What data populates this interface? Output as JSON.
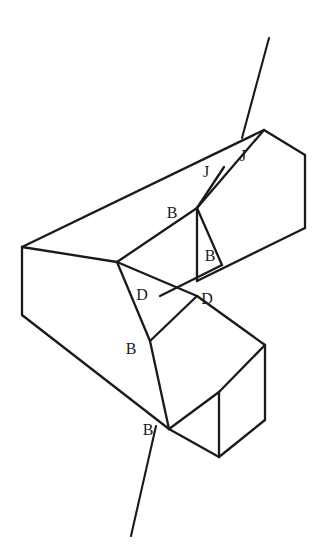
{
  "figure": {
    "type": "line-diagram",
    "background_color": "#ffffff",
    "line_color": "#1a1a1a",
    "label_color": "#1b1b1b",
    "canvas": {
      "width": 321,
      "height": 560
    }
  },
  "labels": [
    {
      "id": "j-right",
      "text": "J",
      "x": 243,
      "y": 161
    },
    {
      "id": "j-left",
      "text": "J",
      "x": 206,
      "y": 177
    },
    {
      "id": "b-upper",
      "text": "B",
      "x": 172,
      "y": 218
    },
    {
      "id": "b-right",
      "text": "B",
      "x": 210,
      "y": 261
    },
    {
      "id": "d-left",
      "text": "D",
      "x": 142,
      "y": 300
    },
    {
      "id": "d-right",
      "text": "D",
      "x": 207,
      "y": 304
    },
    {
      "id": "b-mid",
      "text": "B",
      "x": 131,
      "y": 354
    },
    {
      "id": "b-lower",
      "text": "B",
      "x": 148,
      "y": 435
    }
  ],
  "leaders": [
    {
      "id": "leader-top",
      "from_label": "J",
      "x1": 269,
      "y1": 38,
      "x2": 242,
      "y2": 138
    },
    {
      "id": "leader-bottom",
      "from_label": "B",
      "x1": 156,
      "y1": 426,
      "x2": 131,
      "y2": 536
    }
  ],
  "paths": {
    "upper_bar_top_face": "M 22 247 L 264 130 L 305 155 L 197 208",
    "upper_bar_far_top_edge": "M 264 130 L 197 208",
    "upper_bar_right_end": "M 305 155 L 305 228 L 197 281",
    "upper_bar_lower_long_edge": "M 197 208 L 197 281",
    "notch_upper_left": "M 117 262 L 197 208",
    "notch_lower_left": "M 117 262 L 197 296",
    "notch_cut_b_to_j": "M 197 208 L 224 167",
    "notch_cut_b_to_b": "M 197 208 L 222 265",
    "notch_cut_d": "M 222 265 L 160 296",
    "left_end_top": "M 22 247 L 117 262",
    "left_end_vertical": "M 22 247 L 22 315",
    "front_face_long_edge": "M 22 315 L 169 429",
    "front_face_upper_edge": "M 117 262 L 150 341",
    "lower_bar_inner_cut": "M 150 341 L 169 429",
    "lower_bar_top_face": "M 150 341 L 197 296 L 265 345 L 219 392",
    "lower_bar_front_face": "M 169 429 L 219 392 L 265 345",
    "lower_bar_right_edge": "M 265 345 L 265 420 L 219 457 L 169 429",
    "lower_bar_vertical_mid": "M 219 392 L 219 457"
  },
  "segments": [
    {
      "name": "top-face-left-ridge",
      "x1": 22,
      "y1": 247,
      "x2": 264,
      "y2": 130
    },
    {
      "name": "top-face-right-edge",
      "x1": 264,
      "y1": 130,
      "x2": 305,
      "y2": 155
    },
    {
      "name": "right-end-vertical",
      "x1": 305,
      "y1": 155,
      "x2": 305,
      "y2": 228
    },
    {
      "name": "right-end-lower-edge",
      "x1": 305,
      "y1": 228,
      "x2": 197,
      "y2": 281
    },
    {
      "name": "top-face-inner-ridge",
      "x1": 264,
      "y1": 130,
      "x2": 197,
      "y2": 208
    },
    {
      "name": "inner-vertical-face",
      "x1": 197,
      "y1": 208,
      "x2": 197,
      "y2": 281
    },
    {
      "name": "notch-top-left-edge",
      "x1": 197,
      "y1": 208,
      "x2": 117,
      "y2": 262
    },
    {
      "name": "notch-bottom-left-edge",
      "x1": 117,
      "y1": 262,
      "x2": 197,
      "y2": 296
    },
    {
      "name": "cut-j-to-b",
      "x1": 224,
      "y1": 167,
      "x2": 197,
      "y2": 208
    },
    {
      "name": "cut-b-to-b",
      "x1": 197,
      "y1": 208,
      "x2": 222,
      "y2": 265
    },
    {
      "name": "cut-d-diagonal",
      "x1": 222,
      "y1": 265,
      "x2": 160,
      "y2": 296
    },
    {
      "name": "left-end-top-edge",
      "x1": 22,
      "y1": 247,
      "x2": 117,
      "y2": 262
    },
    {
      "name": "left-end-vertical",
      "x1": 22,
      "y1": 247,
      "x2": 22,
      "y2": 315
    },
    {
      "name": "front-long-bottom-edge",
      "x1": 22,
      "y1": 315,
      "x2": 169,
      "y2": 429
    },
    {
      "name": "front-inner-vertical",
      "x1": 117,
      "y1": 262,
      "x2": 150,
      "y2": 341
    },
    {
      "name": "lower-inner-cut",
      "x1": 150,
      "y1": 341,
      "x2": 169,
      "y2": 429
    },
    {
      "name": "lower-top-face-a",
      "x1": 150,
      "y1": 341,
      "x2": 197,
      "y2": 296
    },
    {
      "name": "lower-top-face-b",
      "x1": 197,
      "y1": 296,
      "x2": 265,
      "y2": 345
    },
    {
      "name": "lower-top-face-c",
      "x1": 265,
      "y1": 345,
      "x2": 219,
      "y2": 392
    },
    {
      "name": "lower-top-face-d",
      "x1": 219,
      "y1": 392,
      "x2": 169,
      "y2": 429
    },
    {
      "name": "lower-right-vertical",
      "x1": 265,
      "y1": 345,
      "x2": 265,
      "y2": 420
    },
    {
      "name": "lower-right-bottom",
      "x1": 265,
      "y1": 420,
      "x2": 219,
      "y2": 457
    },
    {
      "name": "lower-front-bottom",
      "x1": 219,
      "y1": 457,
      "x2": 169,
      "y2": 429
    },
    {
      "name": "lower-front-vertical",
      "x1": 219,
      "y1": 392,
      "x2": 219,
      "y2": 457
    }
  ]
}
